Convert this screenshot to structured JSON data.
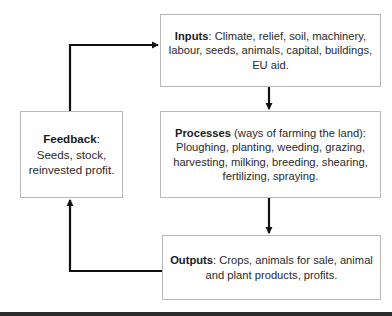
{
  "diagram": {
    "type": "farming system flow diagram",
    "nodes": [
      {
        "id": "inputs",
        "heading": "Inputs",
        "separator": ":",
        "text": " Climate, relief, soil, machinery, labour, seeds, animals, capital, buildings, EU aid."
      },
      {
        "id": "processes",
        "heading": "Processes",
        "separator": "",
        "text": " (ways of farming the land): Ploughing, planting, weeding, grazing, harvesting, milking, breeding, shearing, fertilizing, spraying."
      },
      {
        "id": "outputs",
        "heading": "Outputs",
        "separator": ":",
        "text": " Crops, animals for sale, animal and plant products, profits."
      },
      {
        "id": "feedback",
        "heading": "Feedback",
        "separator": ":",
        "text": " Seeds, stock, reinvested profit."
      }
    ],
    "edges": [
      {
        "from": "inputs",
        "to": "processes"
      },
      {
        "from": "processes",
        "to": "outputs"
      },
      {
        "from": "outputs",
        "to": "feedback"
      },
      {
        "from": "feedback",
        "to": "inputs"
      }
    ],
    "colors": {
      "box_border": "#b9b9b9",
      "arrow": "#111111",
      "text": "#2a2a2a",
      "bottom_bar": "#2b2b2b"
    }
  }
}
